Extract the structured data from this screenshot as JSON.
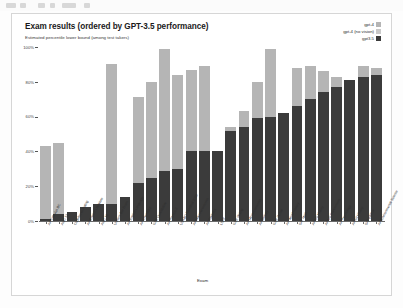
{
  "window": {
    "toolbar_visible": true
  },
  "card": {
    "title": "Exam results (ordered by GPT-3.5 performance)",
    "subtitle": "Estimated percentile lower bound (among test takers)"
  },
  "legend": {
    "position": "top-right",
    "items": [
      {
        "label": "gpt-4",
        "color": "#b5b5b5"
      },
      {
        "label": "gpt-4 (no vision)",
        "color": "#c9c9c9"
      },
      {
        "label": "gpt3.5",
        "color": "#3b3b3b"
      }
    ]
  },
  "chart_data": {
    "type": "bar",
    "subtype": "stacked",
    "title": "Exam results (ordered by GPT-3.5 performance)",
    "subtitle": "Estimated percentile lower bound (among test takers)",
    "xlabel": "Exam",
    "ylabel": "",
    "ylim": [
      0,
      100
    ],
    "yticks": [
      0,
      20,
      40,
      60,
      80,
      100
    ],
    "ytick_labels": [
      "0%",
      "20%",
      "40%",
      "60%",
      "80%",
      "100%"
    ],
    "grid": false,
    "legend_position": "top-right",
    "categories": [
      "AP Calculus BC",
      "AMC 12",
      "Codeforces Rating",
      "AP English Literature",
      "AMC 10",
      "Uniform Bar Exam",
      "AP English Language",
      "AP Chemistry",
      "GRE Quantitative",
      "AP Physics 2",
      "USABO Semifinal 2020",
      "AP Macroeconomics",
      "AP Statistics",
      "LSAT",
      "GRE Writing",
      "AP Microeconomics",
      "AP Biology",
      "GRE Verbal",
      "AP World History",
      "SAT Math",
      "AP US History",
      "AP US Government",
      "AP Psychology",
      "AP Art History",
      "SAT EBRW",
      "AP Environmental Science"
    ],
    "series": [
      {
        "name": "gpt3.5",
        "color": "#3b3b3b",
        "values": [
          1,
          4,
          5,
          8,
          10,
          10,
          14,
          22,
          25,
          29,
          30,
          40,
          40,
          40,
          52,
          54,
          59,
          60,
          62,
          66,
          70,
          74,
          77,
          81,
          83,
          84
        ]
      },
      {
        "name": "gpt-4",
        "color": "#b5b5b5",
        "values": [
          43,
          45,
          5,
          8,
          10,
          90,
          14,
          71,
          80,
          99,
          84,
          87,
          89,
          40,
          54,
          63,
          80,
          99,
          62,
          88,
          89,
          86,
          83,
          81,
          89,
          88
        ]
      }
    ]
  }
}
